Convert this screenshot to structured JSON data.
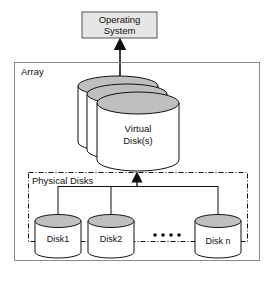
{
  "diagram": {
    "os_box": {
      "line1": "Operating",
      "line2": "System"
    },
    "array_label": "Array",
    "virtual_disk": {
      "line1": "Virtual",
      "line2": "Disk(s)"
    },
    "physical_group_label": "Physical Disks",
    "disks": [
      {
        "label": "Disk1"
      },
      {
        "label": "Disk2"
      },
      {
        "label": "Disk n"
      }
    ],
    "ellipsis": "● ● ● ●",
    "colors": {
      "os_fill": "#e6e6e6",
      "cylinder_top": "#bfbfbf",
      "cylinder_body": "#ffffff",
      "stroke": "#111111",
      "array_border": "#8a8a8a"
    }
  }
}
